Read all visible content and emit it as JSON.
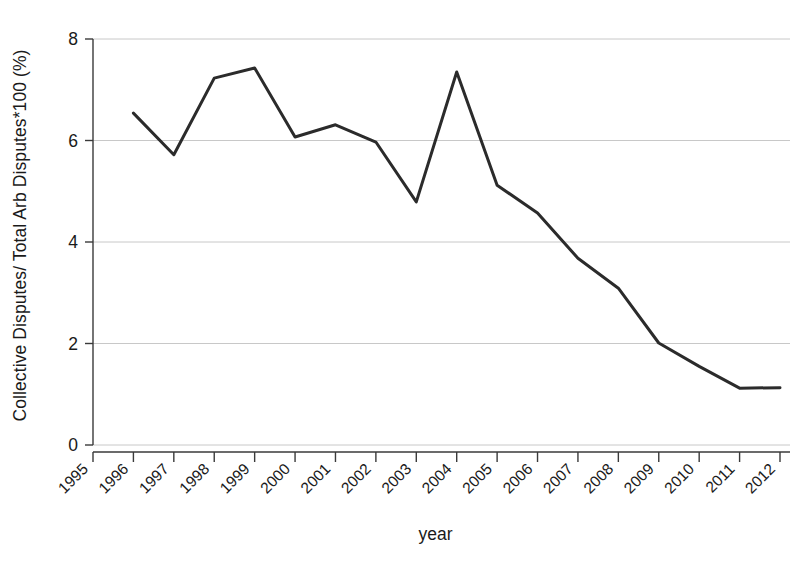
{
  "chart_data": {
    "type": "line",
    "title": "",
    "subtitle": "",
    "xlabel": "year",
    "ylabel": "Collective Disputes/ Total Arb Disputes*100 (%)",
    "x": [
      1995,
      1996,
      1997,
      1998,
      1999,
      2000,
      2001,
      2002,
      2003,
      2004,
      2005,
      2006,
      2007,
      2008,
      2009,
      2010,
      2011,
      2012
    ],
    "xtick_labels": [
      "1995",
      "1996",
      "1997",
      "1998",
      "1999",
      "2000",
      "2001",
      "2002",
      "2003",
      "2004",
      "2005",
      "2006",
      "2007",
      "2008",
      "2009",
      "2010",
      "2011",
      "2012"
    ],
    "ytick_labels": [
      "0",
      "2",
      "4",
      "6",
      "8"
    ],
    "ytick_values": [
      0,
      2,
      4,
      6,
      8
    ],
    "ylim": [
      0,
      8.35
    ],
    "xlim": [
      1995,
      2012
    ],
    "grid": "horizontal",
    "legend": "none",
    "series": [
      {
        "name": "Collective Disputes share",
        "color": "#2b2b2b",
        "line_width": 3,
        "x": [
          1996,
          1997,
          1998,
          1999,
          2000,
          2001,
          2002,
          2003,
          2004,
          2005,
          2006,
          2007,
          2008,
          2009,
          2010,
          2011,
          2012
        ],
        "values": [
          6.54,
          5.72,
          7.23,
          7.43,
          6.07,
          6.31,
          5.97,
          4.79,
          7.35,
          5.12,
          4.57,
          3.68,
          3.09,
          2.01,
          1.55,
          1.12,
          1.13
        ]
      }
    ]
  },
  "axes": {
    "y_axis_label": "Collective Disputes/ Total Arb Disputes*100 (%)",
    "x_axis_label": "year"
  },
  "colors": {
    "line": "#2b2b2b",
    "grid": "#c8c8c8",
    "axis": "#3a3a3a",
    "text": "#1a1a1a",
    "background": "#ffffff"
  }
}
